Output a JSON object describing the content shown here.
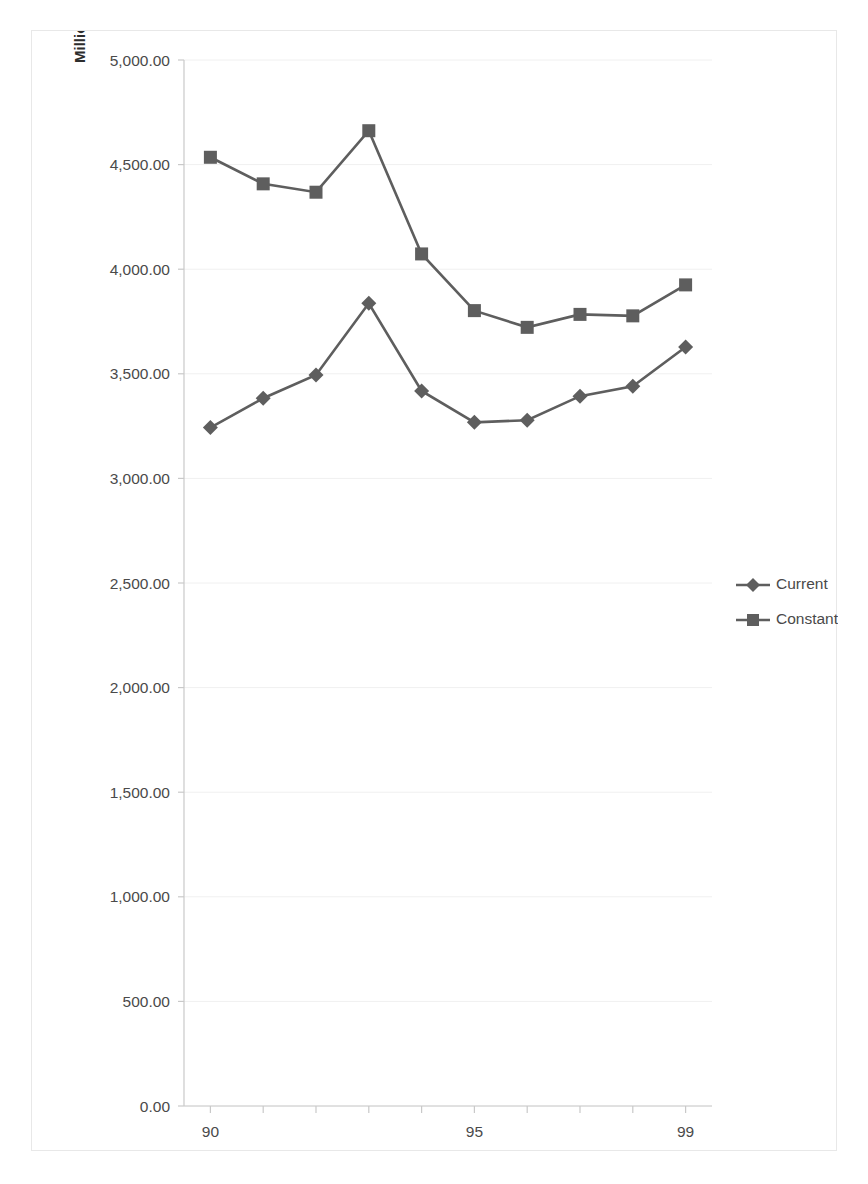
{
  "chart_data": {
    "type": "line",
    "title": "",
    "subtitle": "",
    "xlabel": "",
    "ylabel": "Millions",
    "x": [
      90,
      91,
      92,
      93,
      94,
      95,
      96,
      97,
      98,
      99
    ],
    "x_tick_labels_shown": [
      "90",
      "95",
      "99"
    ],
    "categories": [
      "90",
      "91",
      "92",
      "93",
      "94",
      "95",
      "96",
      "97",
      "98",
      "99"
    ],
    "series": [
      {
        "name": "Current",
        "marker": "diamond",
        "color": "#5e5e5e",
        "values": [
          3243,
          3383,
          3494,
          3837,
          3418,
          3268,
          3278,
          3393,
          3440,
          3628
        ]
      },
      {
        "name": "Constant",
        "marker": "square",
        "color": "#5e5e5e",
        "values": [
          4535,
          4408,
          4368,
          4662,
          4073,
          3802,
          3722,
          3784,
          3777,
          3925
        ]
      }
    ],
    "ylim": [
      0,
      5000
    ],
    "y_ticks": [
      0,
      500,
      1000,
      1500,
      2000,
      2500,
      3000,
      3500,
      4000,
      4500,
      5000
    ],
    "y_tick_labels": [
      "0.00",
      "500.00",
      "1,000.00",
      "1,500.00",
      "2,000.00",
      "2,500.00",
      "3,000.00",
      "3,500.00",
      "4,000.00",
      "4,500.00",
      "5,000.00"
    ],
    "xlim": [
      89.5,
      99.5
    ],
    "grid": true,
    "grid_axis": "y",
    "legend_position": "right",
    "legend_entries": [
      "Current",
      "Constant"
    ]
  },
  "axis": {
    "y_title": "Millions"
  },
  "legend": {
    "items": [
      {
        "label": "Current",
        "marker": "diamond"
      },
      {
        "label": "Constant",
        "marker": "square"
      }
    ]
  },
  "colors": {
    "series_gray": "#5e5e5e",
    "grid": "#f0f0f0",
    "axis": "#c9c9c9",
    "text": "#4a4a4a",
    "border": "#e8e8e8",
    "background": "#ffffff"
  }
}
